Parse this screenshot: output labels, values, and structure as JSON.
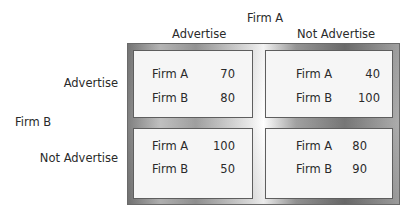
{
  "column_player": {
    "label": "Firm A",
    "strategies": [
      "Advertise",
      "Not Advertise"
    ]
  },
  "row_player": {
    "label": "Firm B",
    "strategies": [
      "Advertise",
      "Not Advertise"
    ]
  },
  "cells": [
    {
      "row": "Advertise",
      "col": "Advertise",
      "payoffs": [
        {
          "firm": "Firm A",
          "value": "70"
        },
        {
          "firm": "Firm B",
          "value": "80"
        }
      ]
    },
    {
      "row": "Advertise",
      "col": "Not Advertise",
      "payoffs": [
        {
          "firm": "Firm A",
          "value": "40"
        },
        {
          "firm": "Firm B",
          "value": "100"
        }
      ]
    },
    {
      "row": "Not Advertise",
      "col": "Advertise",
      "payoffs": [
        {
          "firm": "Firm A",
          "value": "100"
        },
        {
          "firm": "Firm B",
          "value": "50"
        }
      ]
    },
    {
      "row": "Not Advertise",
      "col": "Not Advertise",
      "payoffs": [
        {
          "firm": "Firm A",
          "value": "80"
        },
        {
          "firm": "Firm B",
          "value": "90"
        }
      ]
    }
  ]
}
